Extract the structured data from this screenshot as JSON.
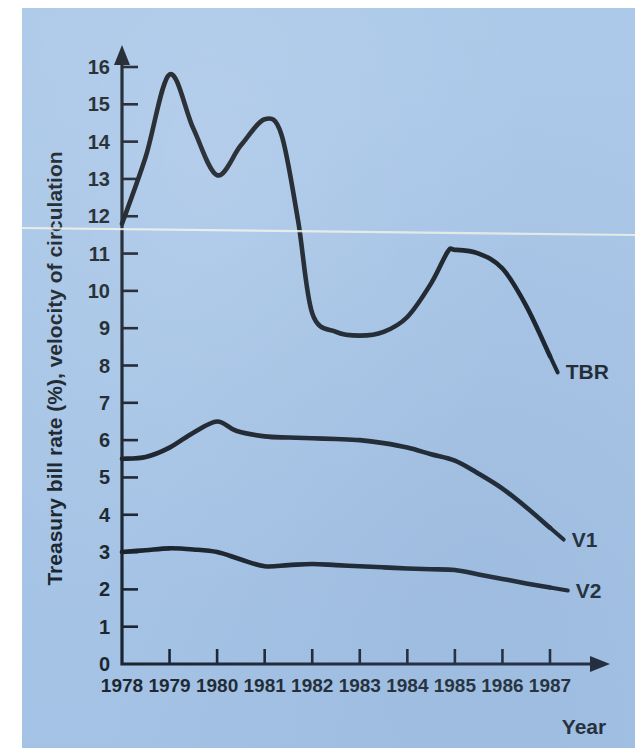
{
  "figure": {
    "background_color": "#a8c6e8",
    "ink_color": "#0b1118",
    "page_margin_color": "#ffffff"
  },
  "axes": {
    "y_axis_title": "Treasury bill rate (%), velocity of circulation",
    "x_axis_title": "Year",
    "y_ticks": [
      "0",
      "1",
      "2",
      "3",
      "4",
      "5",
      "6",
      "7",
      "8",
      "9",
      "10",
      "11",
      "12",
      "13",
      "14",
      "15",
      "16"
    ],
    "x_ticks": [
      "1978",
      "1979",
      "1980",
      "1981",
      "1982",
      "1983",
      "1984",
      "1985",
      "1986",
      "1987"
    ]
  },
  "series_labels": {
    "tbr": "TBR",
    "v1": "V1",
    "v2": "V2"
  },
  "chart_data": {
    "type": "line",
    "title": "",
    "xlabel": "Year",
    "ylabel": "Treasury bill rate (%), velocity of circulation",
    "xlim": [
      1978,
      1987
    ],
    "ylim": [
      0,
      16
    ],
    "grid": false,
    "legend_position": "right-end-of-line labels",
    "x": [
      1978,
      1979,
      1980,
      1981,
      1982,
      1983,
      1984,
      1985,
      1986,
      1987
    ],
    "series": [
      {
        "name": "TBR",
        "label": "TBR",
        "values": [
          11.8,
          15.8,
          13.1,
          14.6,
          9.4,
          8.8,
          9.3,
          11.1,
          10.6,
          8.25
        ],
        "dense_x": [
          1978,
          1978.5,
          1979,
          1979.5,
          1980,
          1980.5,
          1981,
          1981.35,
          1981.7,
          1982,
          1982.5,
          1983,
          1983.5,
          1984,
          1984.5,
          1984.85,
          1985,
          1985.5,
          1986,
          1986.5,
          1987
        ],
        "dense_values": [
          11.8,
          13.6,
          15.8,
          14.35,
          13.1,
          13.9,
          14.6,
          14.2,
          11.9,
          9.4,
          8.9,
          8.8,
          8.9,
          9.3,
          10.2,
          11.05,
          11.1,
          11.0,
          10.6,
          9.6,
          8.25
        ]
      },
      {
        "name": "V1",
        "label": "V1",
        "values": [
          5.5,
          5.8,
          6.5,
          6.1,
          6.05,
          6.0,
          5.8,
          5.45,
          4.7,
          3.65
        ],
        "dense_x": [
          1978,
          1978.5,
          1979,
          1979.5,
          1980,
          1980.4,
          1981,
          1981.5,
          1982,
          1982.5,
          1983,
          1983.5,
          1984,
          1984.5,
          1985,
          1985.5,
          1986,
          1986.5,
          1987
        ],
        "dense_values": [
          5.5,
          5.55,
          5.8,
          6.2,
          6.5,
          6.25,
          6.1,
          6.07,
          6.05,
          6.03,
          6.0,
          5.92,
          5.8,
          5.62,
          5.45,
          5.1,
          4.7,
          4.2,
          3.65
        ]
      },
      {
        "name": "V2",
        "label": "V2",
        "values": [
          3.0,
          3.1,
          3.0,
          2.62,
          2.68,
          2.62,
          2.56,
          2.52,
          2.28,
          2.05
        ],
        "dense_x": [
          1978,
          1978.5,
          1979,
          1979.5,
          1980,
          1980.5,
          1981,
          1981.5,
          1982,
          1982.5,
          1983,
          1983.5,
          1984,
          1984.5,
          1985,
          1985.5,
          1986,
          1986.5,
          1987
        ],
        "dense_values": [
          3.0,
          3.05,
          3.1,
          3.07,
          3.0,
          2.8,
          2.62,
          2.65,
          2.68,
          2.65,
          2.62,
          2.59,
          2.56,
          2.54,
          2.52,
          2.4,
          2.28,
          2.16,
          2.05
        ]
      }
    ]
  }
}
